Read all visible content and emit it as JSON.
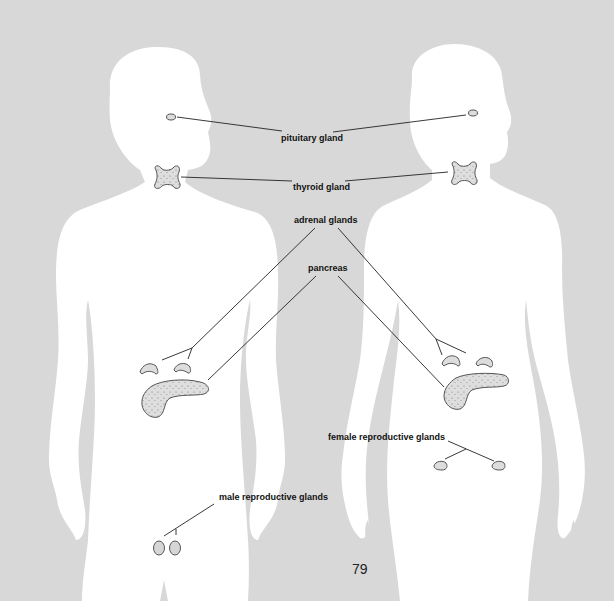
{
  "diagram": {
    "background_color": "#d8d8d8",
    "silhouette_color": "#ffffff",
    "gland_fill": "#dcdcdc",
    "gland_stroke": "#555555",
    "line_color": "#222222",
    "figures": [
      {
        "name": "male",
        "side": "left"
      },
      {
        "name": "female",
        "side": "right"
      }
    ],
    "labels": {
      "pituitary": "pituitary gland",
      "thyroid": "thyroid gland",
      "adrenal": "adrenal glands",
      "pancreas": "pancreas",
      "female_reproductive": "female reproductive glands",
      "male_reproductive": "male reproductive glands"
    },
    "page_number": "79"
  }
}
